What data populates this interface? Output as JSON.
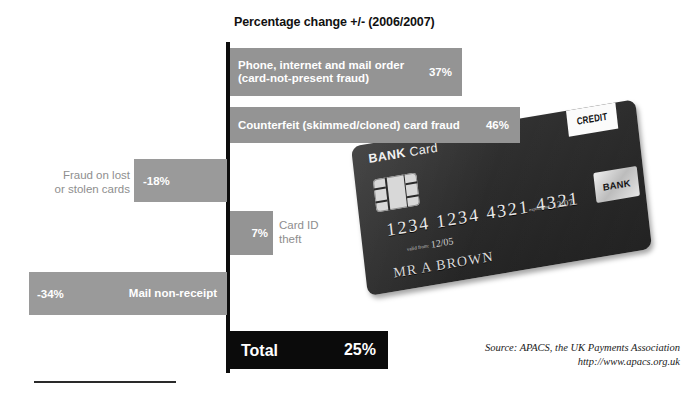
{
  "chart_data": {
    "type": "bar",
    "title": "Percentage change +/- (2006/2007)",
    "orientation": "horizontal",
    "xlabel": "",
    "ylabel": "",
    "grid": false,
    "legend": "none",
    "categories": [
      "Phone, internet and mail order (card-not-present fraud)",
      "Counterfeit (skimmed/cloned) card fraud",
      "Fraud on lost or stolen cards",
      "Card ID theft",
      "Mail non-receipt",
      "Total"
    ],
    "values": [
      37,
      46,
      -18,
      7,
      -34,
      25
    ],
    "value_labels": [
      "37%",
      "46%",
      "-18%",
      "7%",
      "-34%",
      "25%"
    ],
    "series": [
      {
        "name": "Percentage change 2006/2007",
        "points": [
          {
            "label": "Phone, internet and mail order\n(card-not-present fraud)",
            "value": 37,
            "display": "37%",
            "label_position": "inside",
            "style": "positive"
          },
          {
            "label": "Counterfeit (skimmed/cloned) card fraud",
            "value": 46,
            "display": "46%",
            "label_position": "inside",
            "style": "positive"
          },
          {
            "label": "Fraud on lost\nor stolen cards",
            "value": -18,
            "display": "-18%",
            "label_position": "outside",
            "style": "negative"
          },
          {
            "label": "Card ID\ntheft",
            "value": 7,
            "display": "7%",
            "label_position": "outside",
            "style": "positive"
          },
          {
            "label": "Mail non-receipt",
            "value": -34,
            "display": "-34%",
            "label_position": "inside",
            "style": "negative"
          },
          {
            "label": "Total",
            "value": 25,
            "display": "25%",
            "label_position": "inside",
            "style": "total"
          }
        ]
      }
    ]
  },
  "chart": {
    "title": "Percentage change +/- (2006/2007)",
    "bars": {
      "card_not_present": {
        "label": "Phone, internet and mail order\n(card-not-present fraud)",
        "value": "37%"
      },
      "counterfeit": {
        "label": "Counterfeit (skimmed/cloned) card fraud",
        "value": "46%"
      },
      "lost_stolen": {
        "label": "Fraud on lost\nor stolen cards",
        "value": "-18%"
      },
      "card_id_theft": {
        "label": "Card ID\ntheft",
        "value": "7%"
      },
      "mail_non_receipt": {
        "label": "Mail non-receipt",
        "value": "-34%"
      },
      "total": {
        "label": "Total",
        "value": "25%"
      }
    }
  },
  "source": {
    "line1": "Source: APACS, the UK Payments Association",
    "line2": "http://www.apacs.org.uk"
  },
  "card": {
    "bank_bold": "BANK",
    "bank_thin": " Card",
    "credit_badge": "CREDIT",
    "number": "1234  1234  4321  4321",
    "valid_from_caption": "valid\nfrom:",
    "valid_from": "12/05",
    "expires_caption": "expires\nend:",
    "expires": "12/07",
    "holder": "MR A BROWN",
    "logo": "BANK"
  },
  "colors": {
    "bar_positive": "#949494",
    "bar_negative": "#9a9a9a",
    "bar_total": "#0b0b0b",
    "axis": "#0d0d0d",
    "outside_label": "#8e8e8e",
    "background": "#ffffff"
  }
}
